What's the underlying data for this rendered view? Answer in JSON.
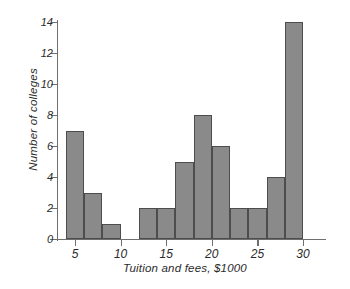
{
  "chart_data": {
    "type": "bar",
    "title": "",
    "subtitle": "",
    "xlabel": "Tuition and fees, $1000",
    "ylabel": "Number of colleges",
    "xlim": [
      3,
      31
    ],
    "ylim": [
      0,
      14
    ],
    "grid": false,
    "legend": null,
    "annotations": [],
    "bin_width": 2,
    "xticks": [
      5,
      10,
      15,
      20,
      25,
      30
    ],
    "xtick_labels": [
      "5",
      "10",
      "15",
      "20",
      "25",
      "30"
    ],
    "yticks": [
      0,
      2,
      4,
      6,
      8,
      10,
      12,
      14
    ],
    "ytick_labels": [
      "0",
      "2",
      "4",
      "6",
      "8",
      "10",
      "12",
      "14"
    ],
    "categories": [
      "4-6",
      "6-8",
      "8-10",
      "10-12",
      "12-14",
      "14-16",
      "16-18",
      "18-20",
      "20-22",
      "22-24",
      "24-26",
      "26-28",
      "28-30"
    ],
    "bin_starts": [
      4,
      6,
      8,
      10,
      12,
      14,
      16,
      18,
      20,
      22,
      24,
      26,
      28
    ],
    "values": [
      7,
      3,
      1,
      0,
      2,
      2,
      5,
      8,
      6,
      2,
      2,
      4,
      14
    ],
    "bar_fill_color": "#8a8a8a",
    "bar_edge_color": "#4d4d4d",
    "axis_color": "#6f6f6f",
    "text_color": "#2b2b2b",
    "background_color": "#ffffff"
  }
}
